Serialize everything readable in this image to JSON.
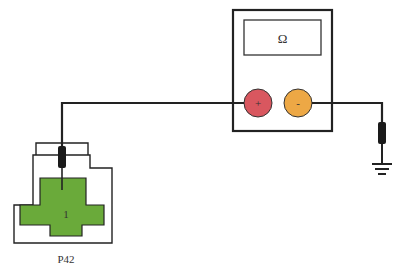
{
  "diagram": {
    "type": "electrical-test-circuit",
    "multimeter": {
      "display_symbol": "Ω",
      "positive_terminal": {
        "symbol": "+",
        "color": "#d9575f"
      },
      "negative_terminal": {
        "symbol": "-",
        "color": "#eda845"
      }
    },
    "connector": {
      "label": "P42",
      "pin_label": "1",
      "pin_color": "#6aaa3a"
    },
    "ground": {
      "symbol": "ground"
    },
    "colors": {
      "wire": "#222222",
      "outline": "#222222",
      "probe": "#1a1a1a"
    }
  }
}
